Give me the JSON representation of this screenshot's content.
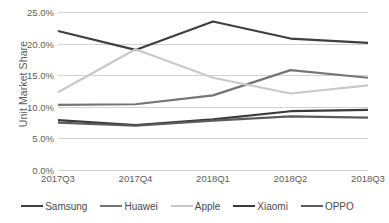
{
  "chart_data": {
    "type": "line",
    "title": "",
    "subtitle": "",
    "xlabel": "",
    "ylabel": "Unit Market Share",
    "categories": [
      "2017Q3",
      "2017Q4",
      "2018Q1",
      "2018Q2",
      "2018Q3"
    ],
    "ylim": [
      0,
      25
    ],
    "yticks": [
      0,
      5,
      10,
      15,
      20,
      25
    ],
    "ytick_labels": [
      "0.0%",
      "5.0%",
      "10.0%",
      "15.0%",
      "20.0%",
      "25.0%"
    ],
    "grid": true,
    "grid_axis": "y",
    "legend_position": "bottom",
    "value_unit": "percent",
    "series": [
      {
        "name": "Samsung",
        "color": "#3f3f42",
        "values": [
          22.0,
          19.0,
          23.5,
          20.8,
          20.1
        ]
      },
      {
        "name": "Huawei",
        "color": "#757578",
        "values": [
          10.3,
          10.4,
          11.8,
          15.8,
          14.6
        ]
      },
      {
        "name": "Apple",
        "color": "#c9c9cb",
        "values": [
          12.3,
          19.1,
          14.6,
          12.1,
          13.4
        ]
      },
      {
        "name": "Xiaomi",
        "color": "#3a3a3d",
        "values": [
          7.9,
          7.1,
          8.0,
          9.3,
          9.5
        ]
      },
      {
        "name": "OPPO",
        "color": "#5c5c5f",
        "values": [
          7.5,
          7.0,
          7.8,
          8.5,
          8.3
        ]
      }
    ]
  },
  "legend": {
    "items": [
      {
        "label": "Samsung",
        "swatch_name": "legend-swatch-samsung"
      },
      {
        "label": "Huawei",
        "swatch_name": "legend-swatch-huawei"
      },
      {
        "label": "Apple",
        "swatch_name": "legend-swatch-apple"
      },
      {
        "label": "Xiaomi",
        "swatch_name": "legend-swatch-xiaomi"
      },
      {
        "label": "OPPO",
        "swatch_name": "legend-swatch-oppo"
      }
    ]
  },
  "colors": {
    "gridline": "#d3d3d5",
    "tick_text": "#5d5d60",
    "legend_text": "#4a4a4d",
    "background": "#ffffff"
  }
}
